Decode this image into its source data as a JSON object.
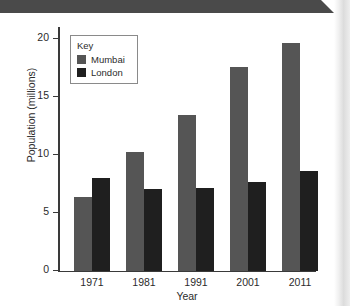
{
  "page": {
    "header_bar_color": "#4a4a4a",
    "background_color": "#ffffff"
  },
  "legend": {
    "title": "Key",
    "position": "inside-top-left",
    "entries": [
      {
        "label": "Mumbai",
        "color": "#555555"
      },
      {
        "label": "London",
        "color": "#1f1f1f"
      }
    ]
  },
  "chart_data": {
    "type": "bar",
    "title": "",
    "xlabel": "Year",
    "ylabel": "Population (millions)",
    "categories": [
      "1971",
      "1981",
      "1991",
      "2001",
      "2011"
    ],
    "series": [
      {
        "name": "Mumbai",
        "color": "#555555",
        "values": [
          6.0,
          9.7,
          12.8,
          16.7,
          18.7
        ]
      },
      {
        "name": "London",
        "color": "#1f1f1f",
        "values": [
          7.6,
          6.7,
          6.8,
          7.3,
          8.2
        ]
      }
    ],
    "ylim": [
      0,
      20
    ],
    "yticks": [
      0,
      5,
      10,
      15,
      20
    ],
    "ytick_labels": [
      "0",
      "5",
      "10",
      "15",
      "20"
    ],
    "grid": false,
    "legend_position": "inside-top-left"
  }
}
